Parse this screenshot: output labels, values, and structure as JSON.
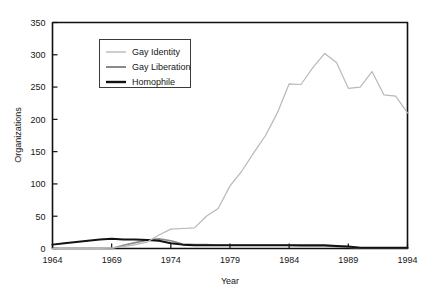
{
  "chart_data": {
    "type": "line",
    "title": "",
    "xlabel": "Year",
    "ylabel": "Organizations",
    "xlim": [
      1964,
      1994
    ],
    "ylim": [
      0,
      350
    ],
    "xticks": [
      1964,
      1969,
      1974,
      1979,
      1984,
      1989,
      1994
    ],
    "yticks": [
      0,
      50,
      100,
      150,
      200,
      250,
      300,
      350
    ],
    "grid": false,
    "legend_position": "upper-left-inset",
    "x": [
      1964,
      1965,
      1966,
      1967,
      1968,
      1969,
      1970,
      1971,
      1972,
      1973,
      1974,
      1975,
      1976,
      1977,
      1978,
      1979,
      1980,
      1981,
      1982,
      1983,
      1984,
      1985,
      1986,
      1987,
      1988,
      1989,
      1990,
      1991,
      1992,
      1993,
      1994
    ],
    "series": [
      {
        "name": "Gay Identity",
        "color": "#b8b8b8",
        "values": [
          0,
          0,
          0,
          0,
          0,
          1,
          3,
          6,
          10,
          21,
          30,
          31,
          32,
          50,
          62,
          97,
          120,
          148,
          175,
          210,
          255,
          254,
          280,
          302,
          288,
          248,
          250,
          274,
          238,
          236,
          210
        ]
      },
      {
        "name": "Gay Liberation",
        "color": "#8a8a8a",
        "values": [
          0,
          0,
          0,
          0,
          0,
          0,
          5,
          9,
          13,
          15,
          12,
          7,
          6,
          6,
          5,
          5,
          5,
          5,
          5,
          5,
          5,
          4,
          4,
          4,
          3,
          2,
          1,
          1,
          1,
          1,
          1
        ]
      },
      {
        "name": "Homophile",
        "color": "#121212",
        "values": [
          6,
          8,
          10,
          12,
          14,
          15,
          14,
          14,
          13,
          12,
          8,
          6,
          5,
          5,
          5,
          5,
          5,
          5,
          5,
          5,
          5,
          5,
          5,
          5,
          4,
          3,
          1,
          1,
          1,
          1,
          1
        ]
      }
    ]
  },
  "axes": {
    "ylabel": "Organizations",
    "xlabel": "Year",
    "ytick_labels": [
      "0",
      "50",
      "100",
      "150",
      "200",
      "250",
      "300",
      "350"
    ],
    "xtick_labels": [
      "1964",
      "1969",
      "1974",
      "1979",
      "1984",
      "1989",
      "1994"
    ]
  },
  "legend": {
    "items": [
      {
        "label": "Gay Identity",
        "color": "#b8b8b8"
      },
      {
        "label": "Gay Liberation",
        "color": "#8a8a8a"
      },
      {
        "label": "Homophile",
        "color": "#121212"
      }
    ]
  }
}
